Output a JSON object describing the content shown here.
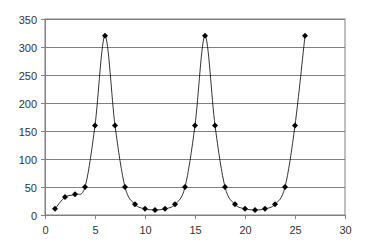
{
  "chart_data": {
    "type": "line",
    "title": "",
    "xlabel": "",
    "ylabel": "",
    "xlim": [
      0,
      30
    ],
    "ylim": [
      0,
      350
    ],
    "x_ticks": [
      0,
      5,
      10,
      15,
      20,
      25,
      30
    ],
    "y_ticks": [
      0,
      50,
      100,
      150,
      200,
      250,
      300,
      350
    ],
    "grid": {
      "horizontal": true,
      "vertical": false
    },
    "legend": null,
    "smooth": true,
    "marker": "diamond",
    "series": [
      {
        "name": "Series 1",
        "color": "#000000",
        "x": [
          1,
          2,
          3,
          4,
          5,
          6,
          7,
          8,
          9,
          10,
          11,
          12,
          13,
          14,
          15,
          16,
          17,
          18,
          19,
          20,
          21,
          22,
          23,
          24,
          25,
          26
        ],
        "values": [
          11,
          32,
          37,
          50,
          160,
          320,
          160,
          50,
          19,
          11,
          9,
          11,
          19,
          50,
          160,
          320,
          160,
          50,
          19,
          11,
          9,
          11,
          19,
          50,
          160,
          320
        ]
      }
    ]
  },
  "colors": {
    "background": "#ffffff",
    "gridline": "#808080",
    "axis": "#808080",
    "line": "#000000",
    "marker": "#000000",
    "tick_text": "#333333"
  }
}
